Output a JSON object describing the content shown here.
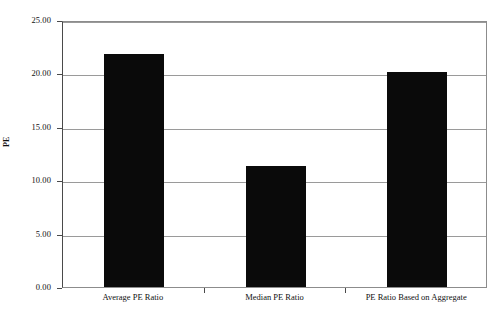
{
  "chart_data": {
    "type": "bar",
    "title": "",
    "xlabel": "",
    "ylabel": "PE",
    "categories": [
      "Average PE Ratio",
      "Median PE Ratio",
      "PE Ratio Based on Aggregate"
    ],
    "values": [
      21.8,
      11.3,
      20.1
    ],
    "ylim": [
      0.0,
      25.0
    ],
    "ytick_values": [
      0.0,
      5.0,
      10.0,
      15.0,
      20.0,
      25.0
    ],
    "ytick_labels": [
      "0.00",
      "5.00",
      "10.00",
      "15.00",
      "20.00",
      "25.00"
    ],
    "grid": true,
    "grid_axis": "y",
    "legend": false,
    "legend_position": "none",
    "bar_color": "#0a0a0a",
    "grid_color": "#9a9a9a",
    "axis_color": "#4a4a4a",
    "plot_background": "#ffffff"
  }
}
